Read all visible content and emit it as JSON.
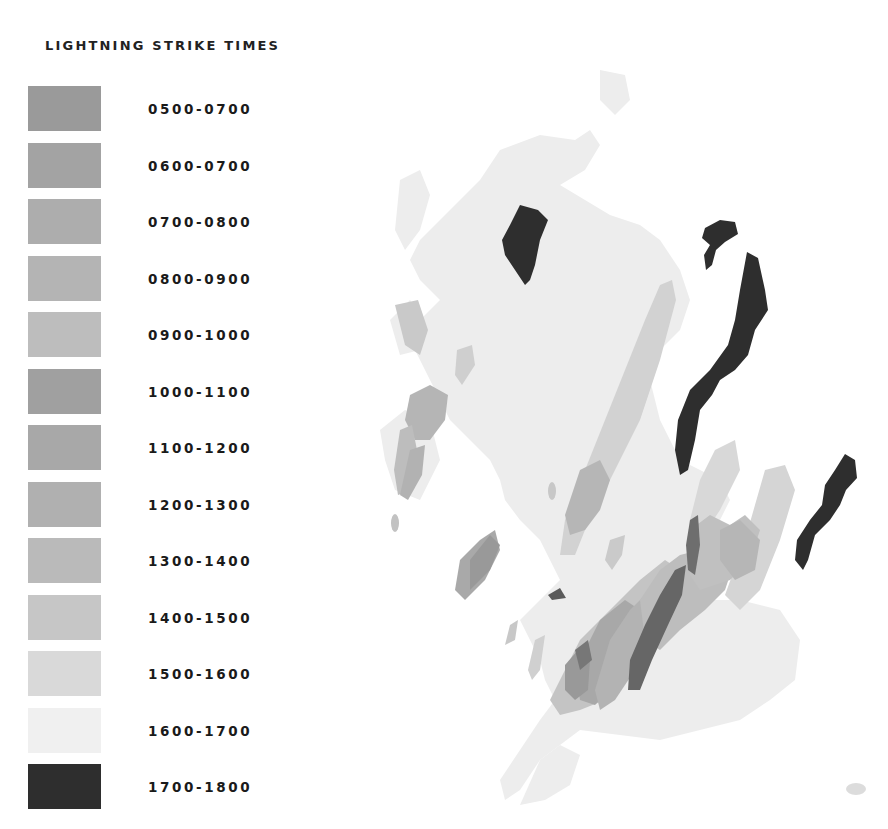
{
  "legend": {
    "title": "LIGHTNING STRIKE TIMES",
    "items": [
      {
        "label": "0500-0700",
        "color": "#9a9a9a"
      },
      {
        "label": "0600-0700",
        "color": "#a3a3a3"
      },
      {
        "label": "0700-0800",
        "color": "#adadad"
      },
      {
        "label": "0800-0900",
        "color": "#b4b4b4"
      },
      {
        "label": "0900-1000",
        "color": "#bdbdbd"
      },
      {
        "label": "1000-1100",
        "color": "#a0a0a0"
      },
      {
        "label": "1100-1200",
        "color": "#a8a8a8"
      },
      {
        "label": "1200-1300",
        "color": "#b0b0b0"
      },
      {
        "label": "1300-1400",
        "color": "#bababa"
      },
      {
        "label": "1400-1500",
        "color": "#c6c6c6"
      },
      {
        "label": "1500-1600",
        "color": "#d9d9d9"
      },
      {
        "label": "1600-1700",
        "color": "#f0f0f0"
      },
      {
        "label": "1700-1800",
        "color": "#2e2e2e"
      }
    ]
  },
  "map": {
    "land_color": "#ececec",
    "description": "Map of Scotland and northern England with shaded lightning strike regions by time band"
  }
}
